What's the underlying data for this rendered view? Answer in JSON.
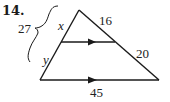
{
  "problem": {
    "number": "14."
  },
  "diagram": {
    "type": "triangle-with-parallel-segment",
    "labels": {
      "brace_total": "27",
      "upper_left_segment": "x",
      "lower_left_segment": "y",
      "upper_right_segment": "16",
      "lower_right_segment": "20",
      "base": "45"
    },
    "colors": {
      "line": "#1a1a1a",
      "background": "#ffffff"
    }
  }
}
